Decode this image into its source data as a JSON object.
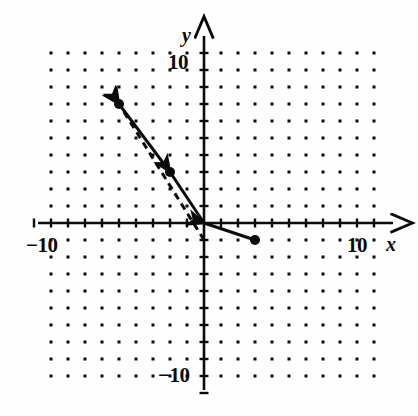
{
  "figure": {
    "background_color": "#fefefe",
    "ink_color": "#0b0b0b"
  },
  "axes": {
    "x_label": "x",
    "y_label": "y",
    "x_tick_right_label": "10",
    "x_tick_left_label": "−10",
    "y_tick_top_label": "10",
    "y_tick_bottom_label": "−10",
    "x_range": [
      -10,
      10
    ],
    "y_range": [
      -10,
      10
    ],
    "origin_px": [
      204,
      223
    ],
    "unit_px": 17.0,
    "arrowheads": [
      "x-positive",
      "y-positive"
    ],
    "tick_interval": 1
  },
  "grid": {
    "type": "dot-grid",
    "visible": true,
    "dot_color": "#0b0b0b",
    "dot_size_px": 3,
    "spacing_units": 1,
    "x_from": -9,
    "x_to": 10,
    "y_from": -9,
    "y_to": 10
  },
  "chart_data": {
    "type": "scatter",
    "title": "",
    "xlabel": "x",
    "ylabel": "y",
    "xlim": [
      -10,
      10
    ],
    "ylim": [
      -10,
      10
    ],
    "grid": true,
    "legend": "none",
    "series": [
      {
        "name": "solid-vector-chain",
        "style": "solid",
        "linewidth": 3,
        "color": "#0b0b0b",
        "direction": "up-left",
        "x": [
          3,
          0,
          -2,
          -5
        ],
        "y": [
          -1,
          0,
          3,
          7
        ],
        "points_marked": [
          [
            -5,
            7
          ],
          [
            -2,
            3
          ],
          [
            3,
            -1
          ]
        ],
        "arrow_tips": [
          [
            -5,
            7
          ],
          [
            -2,
            3
          ],
          [
            0,
            0
          ]
        ]
      },
      {
        "name": "dashed-vector",
        "style": "dashed",
        "linewidth": 3,
        "color": "#0b0b0b",
        "direction": "up-left",
        "x": [
          0,
          -5
        ],
        "y": [
          -1,
          7
        ],
        "arrow_tips": [
          [
            -5,
            7
          ]
        ]
      }
    ],
    "annotations": []
  }
}
